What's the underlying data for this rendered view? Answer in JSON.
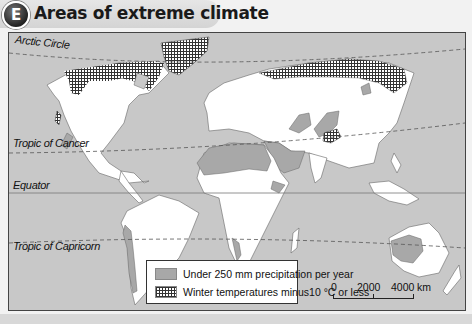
{
  "header": {
    "badge": "E",
    "title": "Areas of extreme climate"
  },
  "map": {
    "lines": {
      "arctic_circle": "Arctic Circle",
      "tropic_of_cancer": "Tropic of Cancer",
      "equator": "Equator",
      "tropic_of_capricorn": "Tropic of Capricorn"
    },
    "colors": {
      "ocean": "#c8c8c8",
      "land": "#ffffff",
      "dry": "#a8a8a8",
      "cold_pattern": "#333333"
    }
  },
  "legend": {
    "items": [
      {
        "id": "dry",
        "label": "Under 250 mm precipitation per year"
      },
      {
        "id": "cold",
        "label": "Winter temperatures minus10 °C or less"
      }
    ]
  },
  "scale": {
    "ticks": [
      "0",
      "2000",
      "4000"
    ],
    "unit": "km"
  }
}
